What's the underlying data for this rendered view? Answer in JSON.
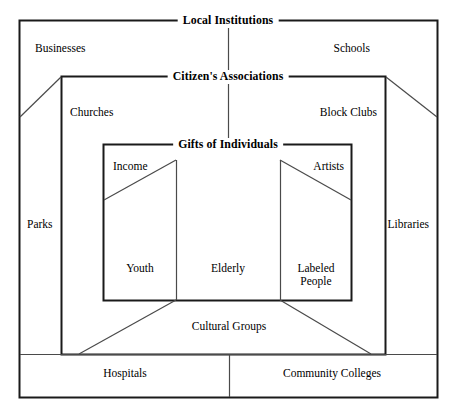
{
  "diagram": {
    "title": "Local Institutions",
    "type": "nested-boxes-community-assets-map",
    "rings": [
      {
        "name": "local-institutions",
        "title": "Local Institutions",
        "level": 1,
        "members": [
          "Businesses",
          "Schools",
          "Parks",
          "Libraries",
          "Hospitals",
          "Community Colleges"
        ]
      },
      {
        "name": "citizens-associations",
        "title": "Citizen's Associations",
        "level": 2,
        "members": [
          "Churches",
          "Block Clubs",
          "Cultural Groups"
        ]
      },
      {
        "name": "gifts-of-individuals",
        "title": "Gifts of Individuals",
        "level": 3,
        "members": [
          "Income",
          "Artists",
          "Youth",
          "Elderly",
          "Labeled People"
        ]
      }
    ],
    "labels": {
      "outer_title": "Local Institutions",
      "middle_title": "Citizen's Associations",
      "inner_title": "Gifts of Individuals",
      "businesses": "Businesses",
      "schools": "Schools",
      "churches": "Churches",
      "block_clubs": "Block Clubs",
      "parks": "Parks",
      "libraries": "Libraries",
      "income": "Income",
      "artists": "Artists",
      "youth": "Youth",
      "elderly": "Elderly",
      "labeled_people_line1": "Labeled",
      "labeled_people_line2": "People",
      "cultural_groups": "Cultural Groups",
      "hospitals": "Hospitals",
      "community_colleges": "Community Colleges"
    },
    "colors": {
      "stroke": "#1a1a1a",
      "thin_stroke": "#4a4a4a",
      "background": "#ffffff",
      "text": "#000000"
    }
  }
}
